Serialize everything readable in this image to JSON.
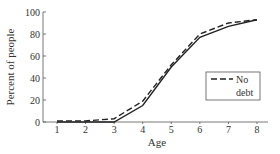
{
  "chart_data": {
    "type": "line",
    "title": "",
    "xlabel": "Age",
    "ylabel": "Percent of people",
    "x": [
      1,
      2,
      3,
      4,
      5,
      6,
      7,
      8
    ],
    "xticks": [
      "1",
      "2",
      "3",
      "4",
      "5",
      "6",
      "7",
      "8"
    ],
    "yticks": [
      "0",
      "20",
      "40",
      "60",
      "80",
      "100"
    ],
    "ylim": [
      0,
      100
    ],
    "xlim": [
      0.5,
      8.5
    ],
    "grid": false,
    "legend_position": "lower right (inside)",
    "series": [
      {
        "name": "",
        "style": "solid",
        "values": [
          0,
          0,
          0,
          15,
          50,
          77,
          87,
          93
        ]
      },
      {
        "name": "No debt",
        "style": "dashed",
        "values": [
          1,
          1,
          3,
          19,
          52,
          80,
          90,
          93
        ]
      }
    ]
  },
  "legend": {
    "line1": "No",
    "line2": "debt"
  }
}
